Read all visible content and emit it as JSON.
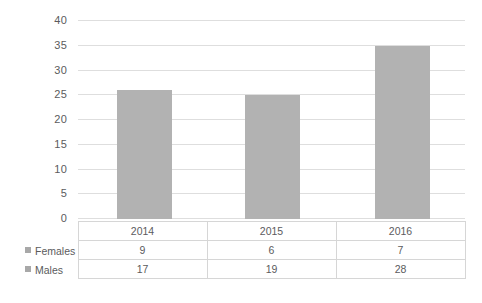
{
  "chart_data": {
    "type": "bar",
    "title": "",
    "subtitle": "",
    "xlabel": "",
    "ylabel": "",
    "categories": [
      "2014",
      "2015",
      "2016"
    ],
    "series": [
      {
        "name": "Females",
        "values": [
          9,
          6,
          7
        ]
      },
      {
        "name": "Males",
        "values": [
          17,
          19,
          28
        ]
      }
    ],
    "bar_totals": [
      26,
      25,
      35
    ],
    "ylim": [
      0,
      40
    ],
    "yticks": [
      "0",
      "5",
      "10",
      "15",
      "20",
      "25",
      "30",
      "35",
      "40"
    ],
    "grid": true,
    "legend_position": "table-left",
    "bar_color": "#b2b2b2",
    "gridline_color": "#dedede",
    "table_border_color": "#d6d6d6",
    "text_color": "#5b5b5d"
  },
  "table": {
    "header": [
      "",
      "2014",
      "2015",
      "2016"
    ],
    "rows": [
      {
        "label": "Females",
        "values": [
          "9",
          "6",
          "7"
        ]
      },
      {
        "label": "Males",
        "values": [
          "17",
          "19",
          "28"
        ]
      }
    ]
  },
  "axis": {
    "t0": "0",
    "t1": "5",
    "t2": "10",
    "t3": "15",
    "t4": "20",
    "t5": "25",
    "t6": "30",
    "t7": "35",
    "t8": "40"
  }
}
